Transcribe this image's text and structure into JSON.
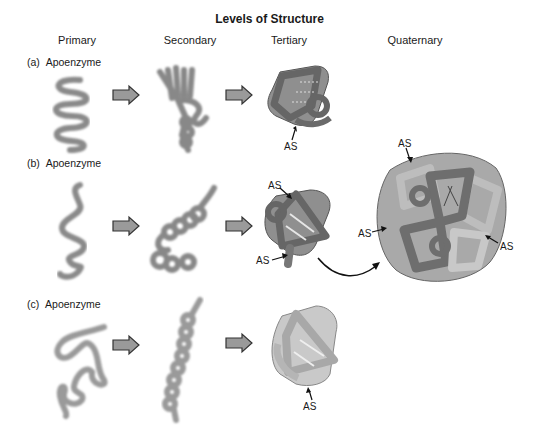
{
  "title": "Levels of Structure",
  "columns": [
    "Primary",
    "Secondary",
    "Tertiary",
    "Quaternary"
  ],
  "rows": [
    {
      "id": "a",
      "label": "(a)",
      "name": "Apoenzyme",
      "active_site_labels": [
        "AS"
      ]
    },
    {
      "id": "b",
      "label": "(b)",
      "name": "Apoenzyme",
      "active_site_labels": [
        "AS",
        "AS"
      ],
      "quaternary_active_site_labels": [
        "AS",
        "AS",
        "AS"
      ]
    },
    {
      "id": "c",
      "label": "(c)",
      "name": "Apoenzyme",
      "active_site_labels": [
        "AS"
      ]
    }
  ],
  "as_label": "AS",
  "colors": {
    "chain": "#8a8a8a",
    "tertiary_dark": "#6f6f6f",
    "tertiary_light": "#b8b8b8",
    "arrow_fill": "#9a9a9a",
    "arrow_stroke": "#333333"
  }
}
